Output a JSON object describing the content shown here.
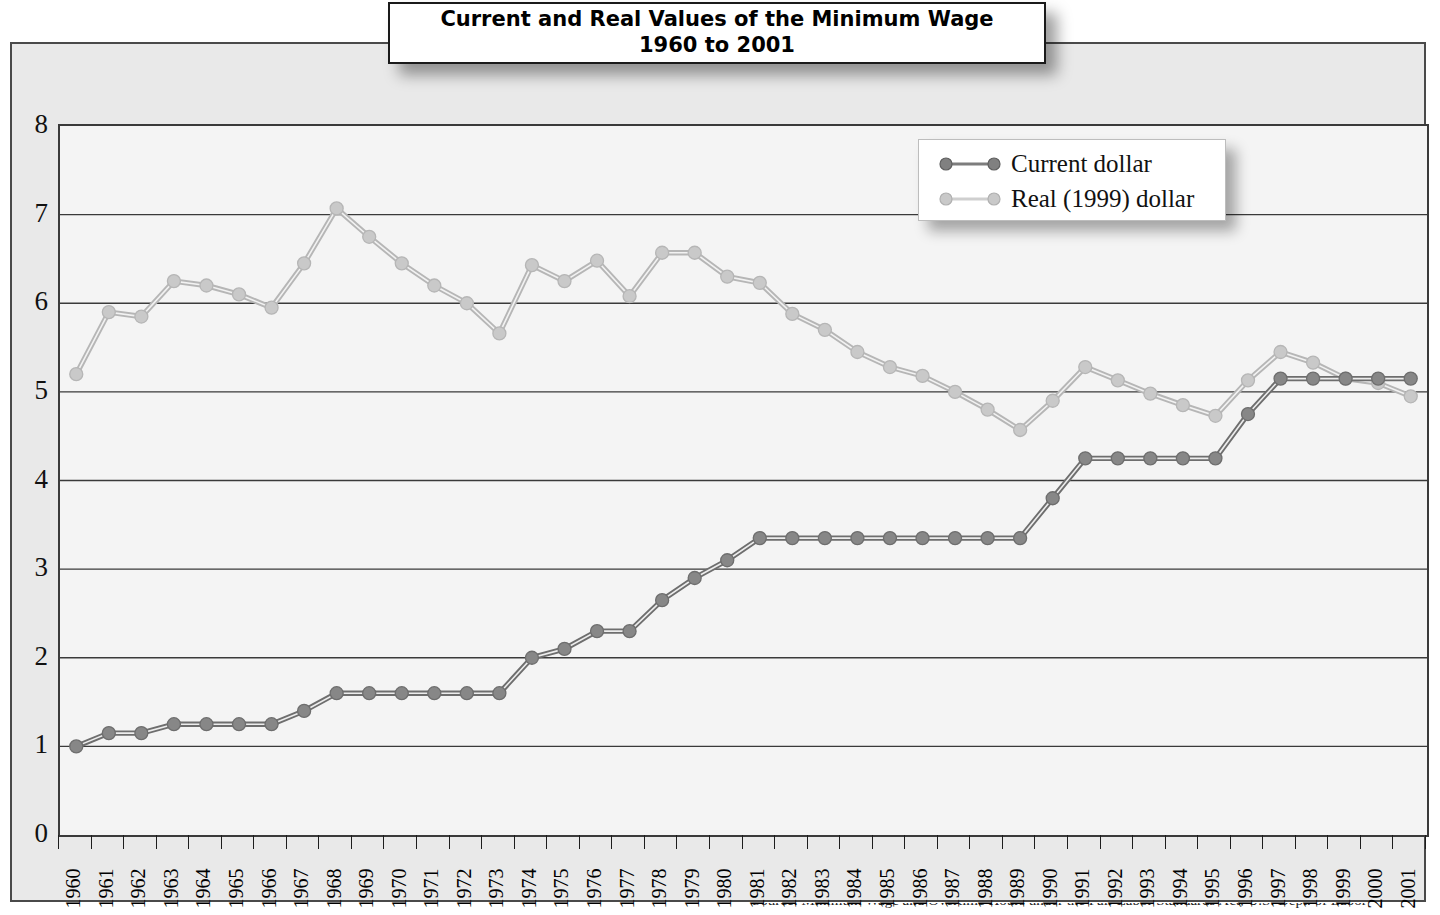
{
  "title": {
    "line1": "Current and Real Values of the Minimum Wage",
    "line2": "1960 to 2001"
  },
  "legend": {
    "position": "top-right",
    "items": [
      {
        "label": "Current dollar",
        "color": "#7d7d7d"
      },
      {
        "label": "Real (1999) dollar",
        "color": "#c3c3c3"
      }
    ]
  },
  "axes": {
    "y_ticks": [
      "8",
      "7",
      "6",
      "5",
      "4",
      "3",
      "2",
      "1",
      "0"
    ],
    "x_ticks": [
      "1960",
      "1961",
      "1962",
      "1963",
      "1964",
      "1965",
      "1966",
      "1967",
      "1968",
      "1969",
      "1970",
      "1971",
      "1972",
      "1973",
      "1974",
      "1975",
      "1976",
      "1977",
      "1978",
      "1979",
      "1980",
      "1981",
      "1982",
      "1983",
      "1984",
      "1985",
      "1986",
      "1987",
      "1988",
      "1989",
      "1990",
      "1991",
      "1992",
      "1993",
      "1994",
      "1995",
      "1996",
      "1997",
      "1998",
      "1999",
      "2000",
      "2001"
    ]
  },
  "source_sliver": "Source: Minimum Wage and Overtime Hours under the Fair Labor Standards Act, U.S. Dept. of Labor",
  "chart_data": {
    "type": "line",
    "title": "Current and Real Values of the Minimum Wage 1960 to 2001",
    "xlabel": "",
    "ylabel": "",
    "ylim": [
      0,
      8
    ],
    "ytick_step": 1,
    "grid": true,
    "legend_position": "top-right",
    "categories": [
      "1960",
      "1961",
      "1962",
      "1963",
      "1964",
      "1965",
      "1966",
      "1967",
      "1968",
      "1969",
      "1970",
      "1971",
      "1972",
      "1973",
      "1974",
      "1975",
      "1976",
      "1977",
      "1978",
      "1979",
      "1980",
      "1981",
      "1982",
      "1983",
      "1984",
      "1985",
      "1986",
      "1987",
      "1988",
      "1989",
      "1990",
      "1991",
      "1992",
      "1993",
      "1994",
      "1995",
      "1996",
      "1997",
      "1998",
      "1999",
      "2000",
      "2001"
    ],
    "series": [
      {
        "name": "Current dollar",
        "color": "#7d7d7d",
        "values": [
          1.0,
          1.15,
          1.15,
          1.25,
          1.25,
          1.25,
          1.25,
          1.4,
          1.6,
          1.6,
          1.6,
          1.6,
          1.6,
          1.6,
          2.0,
          2.1,
          2.3,
          2.3,
          2.65,
          2.9,
          3.1,
          3.35,
          3.35,
          3.35,
          3.35,
          3.35,
          3.35,
          3.35,
          3.35,
          3.35,
          3.8,
          4.25,
          4.25,
          4.25,
          4.25,
          4.25,
          4.75,
          5.15,
          5.15,
          5.15,
          5.15,
          5.15
        ]
      },
      {
        "name": "Real (1999) dollar",
        "color": "#c3c3c3",
        "values": [
          5.2,
          5.9,
          5.85,
          6.25,
          6.2,
          6.1,
          5.95,
          6.45,
          7.07,
          6.75,
          6.45,
          6.2,
          6.0,
          5.66,
          6.43,
          6.25,
          6.48,
          6.08,
          6.57,
          6.57,
          6.3,
          6.23,
          5.88,
          5.7,
          5.45,
          5.28,
          5.18,
          5.0,
          4.8,
          4.57,
          4.9,
          5.28,
          5.13,
          4.98,
          4.85,
          4.73,
          5.13,
          5.45,
          5.33,
          5.15,
          5.1,
          4.95
        ]
      }
    ]
  }
}
